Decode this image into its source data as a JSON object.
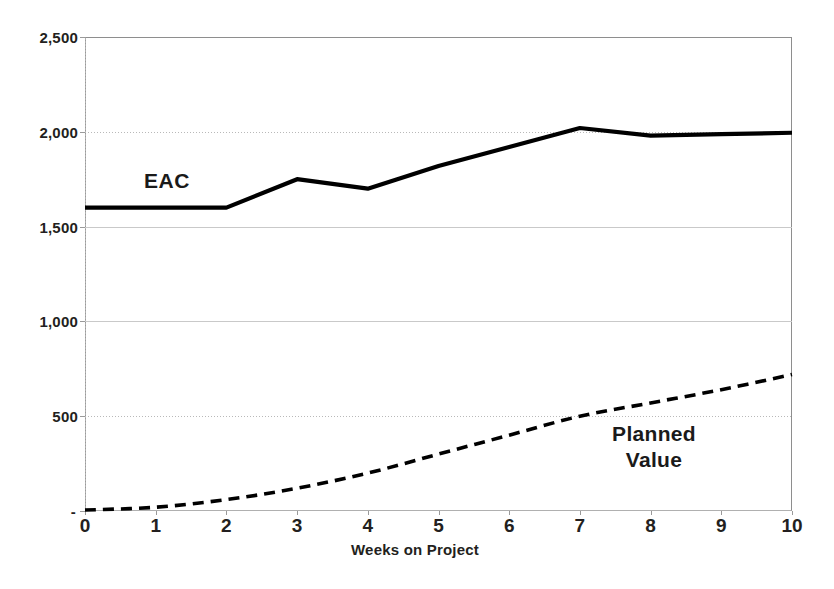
{
  "chart_data": {
    "type": "line",
    "title": "",
    "subtitle": "",
    "xlabel": "Weeks on Project",
    "ylabel": "",
    "x": [
      0,
      1,
      2,
      3,
      4,
      5,
      6,
      7,
      8,
      9,
      10
    ],
    "xlim": [
      0,
      10
    ],
    "ylim": [
      0,
      2500
    ],
    "x_tick_labels": [
      "0",
      "1",
      "2",
      "3",
      "4",
      "5",
      "6",
      "7",
      "8",
      "9",
      "10"
    ],
    "y_ticks": [
      0,
      500,
      1000,
      1500,
      2000,
      2500
    ],
    "y_tick_labels": [
      "-",
      "500",
      "1,000",
      "1,500",
      "2,000",
      "2,500"
    ],
    "grid": true,
    "legend_position": "inline-annotation",
    "series": [
      {
        "name": "EAC",
        "style": "solid",
        "color": "#000000",
        "values": [
          1600,
          1600,
          1600,
          1750,
          1700,
          1820,
          1920,
          2020,
          1980,
          1988,
          1995
        ]
      },
      {
        "name": "Planned Value",
        "style": "dashed",
        "color": "#000000",
        "values": [
          5,
          20,
          60,
          120,
          200,
          300,
          400,
          500,
          570,
          640,
          720
        ]
      }
    ],
    "annotations": [
      {
        "text": "EAC",
        "series": "EAC",
        "x": 1.1,
        "y": 1900
      },
      {
        "text": "Planned\nValue",
        "series": "Planned Value",
        "x": 7.6,
        "y": 420
      }
    ]
  },
  "axis": {
    "x_title": "Weeks on Project",
    "x_ticks": [
      "0",
      "1",
      "2",
      "3",
      "4",
      "5",
      "6",
      "7",
      "8",
      "9",
      "10"
    ],
    "y_ticks": [
      "2,500",
      "2,000",
      "1,500",
      "1,000",
      "500",
      "-"
    ]
  },
  "labels": {
    "eac": "EAC",
    "planned_value": "Planned\nValue"
  },
  "colors": {
    "series": "#000000",
    "gridline": "#c9c9c9",
    "plot_border": "#8e8e8e",
    "text": "#231f20",
    "background": "#ffffff"
  }
}
